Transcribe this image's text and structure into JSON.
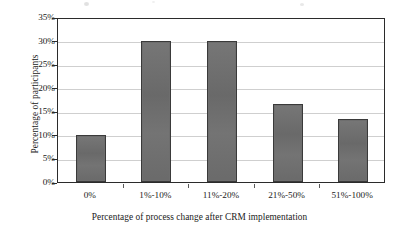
{
  "chart_data": {
    "type": "bar",
    "title": "",
    "categories": [
      "0%",
      "1%-10%",
      "11%-20%",
      "21%-50%",
      "51%-100%"
    ],
    "values": [
      10,
      30,
      30,
      16.5,
      13.3
    ],
    "xlabel": "Percentage of process change after CRM implementation",
    "ylabel": "Percentage of participants",
    "ylim": [
      0,
      35
    ],
    "ytick_labels": [
      "0%",
      "5%",
      "10%",
      "15%",
      "20%",
      "25%",
      "30%",
      "35%"
    ],
    "ytick_values": [
      0,
      5,
      10,
      15,
      20,
      25,
      30,
      35
    ],
    "grid": true,
    "legend": false,
    "legend_position": "none",
    "series": [
      {
        "name": "Percentage of participants",
        "values": [
          10,
          30,
          30,
          16.5,
          13.3
        ]
      }
    ]
  },
  "style": {
    "bar_fill": "#6e6e6e",
    "bar_stroke": "#3a3a3a",
    "gridline_color": "#cfcfcf",
    "frame_color": "#2b2b2b",
    "background": "#ffffff",
    "text_color": "#1a1a1a"
  }
}
